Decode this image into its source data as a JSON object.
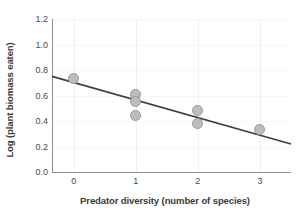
{
  "chart_data": {
    "type": "scatter",
    "title": "",
    "xlabel": "Predator diversity (number of species)",
    "ylabel": "Log (plant biomass eaten)",
    "xlim": [
      -0.35,
      3.5
    ],
    "ylim": [
      0.0,
      1.2
    ],
    "xticks": [
      0,
      1,
      2,
      3
    ],
    "xtick_labels": [
      "0",
      "1",
      "2",
      "3"
    ],
    "yticks": [
      0.0,
      0.2,
      0.4,
      0.6,
      0.8,
      1.0,
      1.2
    ],
    "ytick_labels": [
      "0.0",
      "0.2",
      "0.4",
      "0.6",
      "0.8",
      "1.0",
      "1.2"
    ],
    "grid": "faint vertical gridlines at x ticks, faint horizontal gridlines at y ticks",
    "legend": "none",
    "points": [
      {
        "x": 0,
        "y": 0.73
      },
      {
        "x": 1,
        "y": 0.61
      },
      {
        "x": 1,
        "y": 0.55
      },
      {
        "x": 1,
        "y": 0.44
      },
      {
        "x": 2,
        "y": 0.48
      },
      {
        "x": 2,
        "y": 0.38
      },
      {
        "x": 3,
        "y": 0.33
      }
    ],
    "series": [
      {
        "name": "Observations",
        "x": [
          0,
          1,
          1,
          1,
          2,
          2,
          3
        ],
        "values": [
          0.73,
          0.61,
          0.55,
          0.44,
          0.48,
          0.38,
          0.33
        ]
      }
    ],
    "trendline": {
      "type": "line",
      "x": [
        -0.35,
        3.5
      ],
      "y": [
        0.75,
        0.22
      ],
      "intercept": 0.7017,
      "slope": -0.1377
    },
    "colors": {
      "marker_fill": "#bdbdbd",
      "marker_edge": "#9a9a9a",
      "trendline": "#3f3f3f",
      "axis": "#8d8d8d",
      "text": "#3a3a3a",
      "gridline": "#f0f0f0",
      "background": "#ffffff"
    }
  }
}
